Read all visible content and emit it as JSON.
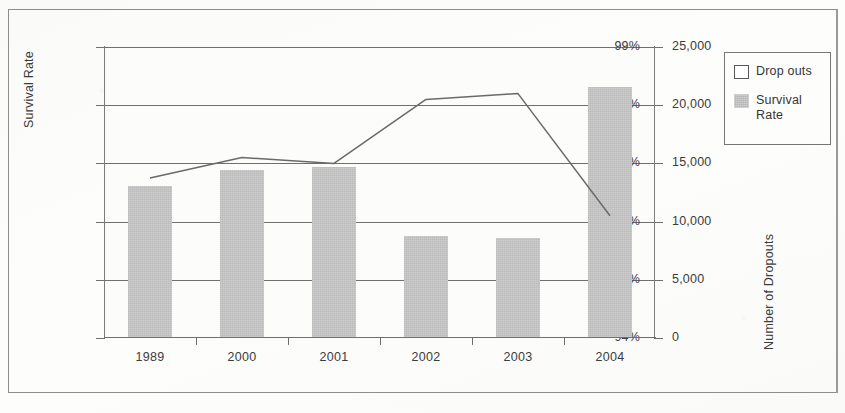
{
  "chart_data": {
    "type": "bar",
    "title": "",
    "subtitle": "",
    "xlabel": "Year",
    "ylabel": "Survival Rate",
    "y2label": "Number of Dropouts",
    "categories": [
      "1989",
      "2000",
      "2001",
      "2002",
      "2003",
      "2004"
    ],
    "grid": true,
    "legend_position": "top-right",
    "ylim": [
      94,
      99
    ],
    "y2lim": [
      0,
      25000
    ],
    "y_ticks": [
      "94%",
      "95%",
      "96%",
      "97%",
      "98%",
      "99%"
    ],
    "y_tick_values": [
      94,
      95,
      96,
      97,
      98,
      99
    ],
    "y2_ticks": [
      "0",
      "5,000",
      "10,000",
      "15,000",
      "20,000",
      "25,000"
    ],
    "y2_tick_values": [
      0,
      5000,
      10000,
      15000,
      20000,
      25000
    ],
    "series": [
      {
        "name": "Survival Rate",
        "type": "bar",
        "axis": "right",
        "color": "#c9c9c9",
        "values": [
          13100,
          14400,
          14700,
          8800,
          8600,
          21600
        ]
      },
      {
        "name": "Drop outs",
        "type": "line",
        "axis": "left",
        "color": "#6a6a6a",
        "values": [
          96.75,
          97.1,
          97.0,
          98.1,
          98.2,
          96.1
        ]
      }
    ]
  },
  "legend": {
    "items": [
      {
        "label": "Drop outs",
        "swatch": "outline"
      },
      {
        "label": "Survival\nRate",
        "swatch": "filled"
      }
    ]
  },
  "axes": {
    "left_title": "Survival Rate",
    "right_title": "Number of Dropouts",
    "bottom_title": "Year"
  }
}
